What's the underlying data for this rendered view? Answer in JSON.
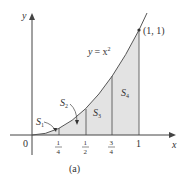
{
  "figure": {
    "caption": "(a)",
    "curve_label_y": "y",
    "curve_label_eq": "= x",
    "curve_label_exp": "2",
    "point_label": "(1, 1)",
    "axis_x_label": "x",
    "axis_y_label": "y",
    "origin_label": "0",
    "ticks": [
      {
        "num": "1",
        "den": "4"
      },
      {
        "num": "1",
        "den": "2"
      },
      {
        "num": "3",
        "den": "4"
      },
      {
        "label": "1"
      }
    ],
    "regions": [
      {
        "label": "S",
        "sub": "1"
      },
      {
        "label": "S",
        "sub": "2"
      },
      {
        "label": "S",
        "sub": "3"
      },
      {
        "label": "S",
        "sub": "4"
      }
    ],
    "colors": {
      "fill": "#e3e3e3",
      "line": "#555555"
    }
  }
}
